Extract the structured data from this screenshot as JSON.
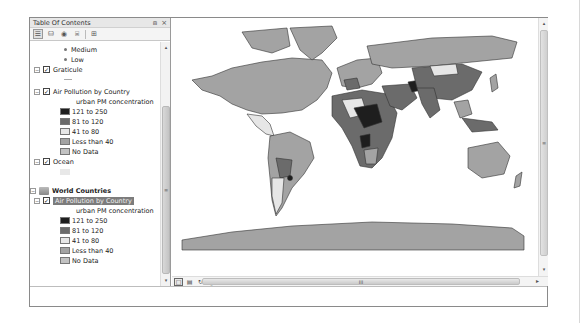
{
  "toc": {
    "title": "Table Of Contents",
    "header_buttons": [
      "pin-icon",
      "close-icon"
    ],
    "header_glyphs": {
      "pin": "⩎",
      "close": "×"
    },
    "toolbar": [
      {
        "name": "list-by-drawing-order",
        "glyph": "☰",
        "active": true
      },
      {
        "name": "list-by-source",
        "glyph": "⛁",
        "active": false
      },
      {
        "name": "list-by-visibility",
        "glyph": "◉",
        "active": false
      },
      {
        "name": "list-by-selection",
        "glyph": "⌸",
        "active": false
      },
      {
        "name": "options",
        "glyph": "⊞",
        "active": false
      }
    ],
    "tree": {
      "bullet_items": [
        "Medium",
        "Low"
      ],
      "graticule": {
        "label": "Graticule",
        "checked": true
      },
      "layer1": {
        "label": "Air Pollution by Country",
        "field": "urban PM concentration",
        "classes": [
          {
            "label": "121 to 250",
            "color": "#1e1e1e"
          },
          {
            "label": "81 to 120",
            "color": "#6b6b6b"
          },
          {
            "label": "41 to 80",
            "color": "#e6e6e6"
          },
          {
            "label": "Less than 40",
            "color": "#a3a3a3"
          },
          {
            "label": "No Data",
            "color": "#c2c2c2"
          }
        ]
      },
      "ocean": {
        "label": "Ocean",
        "checked": true
      },
      "group": {
        "label": "World Countries"
      },
      "layer2": {
        "label": "Air Pollution by Country",
        "field": "urban PM concentration",
        "selected": true,
        "classes": [
          {
            "label": "121 to 250",
            "color": "#1e1e1e"
          },
          {
            "label": "81 to 120",
            "color": "#6b6b6b"
          },
          {
            "label": "41 to 80",
            "color": "#e6e6e6"
          },
          {
            "label": "Less than 40",
            "color": "#a3a3a3"
          },
          {
            "label": "No Data",
            "color": "#c2c2c2"
          }
        ]
      }
    },
    "scroll_glyphs": {
      "up": "▴",
      "down": "▾",
      "grip": "≡"
    }
  },
  "map": {
    "view_buttons": [
      {
        "name": "data-view",
        "glyph": "□",
        "active": true
      },
      {
        "name": "layout-view",
        "glyph": "▤",
        "active": false
      },
      {
        "name": "refresh",
        "glyph": "↻",
        "active": false
      },
      {
        "name": "pause-drawing",
        "glyph": "‖",
        "active": false
      }
    ],
    "scroll_glyphs": {
      "left": "◂",
      "right": "▸",
      "up": "▴",
      "down": "▾",
      "grip_h": "III",
      "grip_v": "≡"
    }
  }
}
